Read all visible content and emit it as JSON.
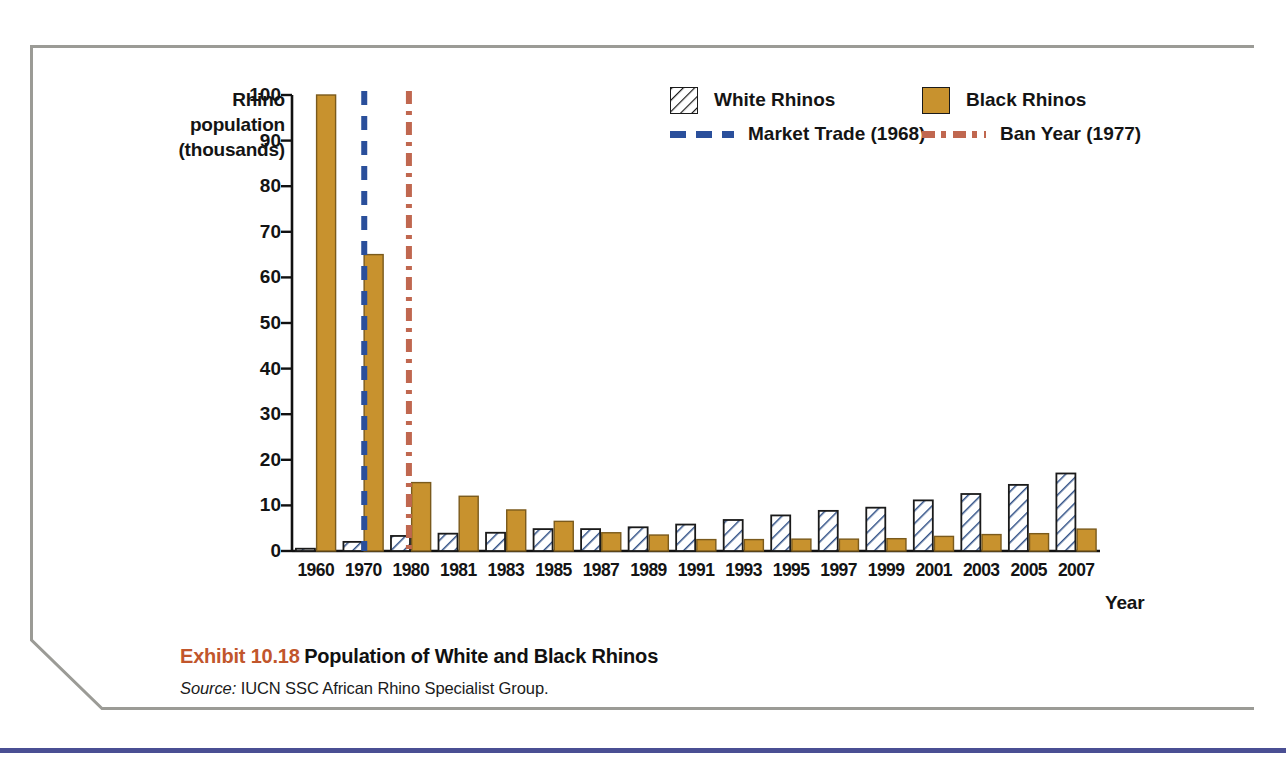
{
  "exhibit": {
    "number": "Exhibit 10.18",
    "title": "Population of White and Black Rhinos",
    "source_label": "Source:",
    "source_text": "IUCN SSC African Rhino Specialist Group."
  },
  "legend": {
    "white_rhinos": "White Rhinos",
    "black_rhinos": "Black Rhinos",
    "market_trade": "Market Trade (1968)",
    "ban_year": "Ban Year (1977)"
  },
  "colors": {
    "black_rhino_fill": "#c8922e",
    "white_rhino_fill": "#ffffff",
    "hatch_stroke": "#2f4f86",
    "market_trade_line": "#2a4f9b",
    "ban_year_line": "#c0674f",
    "exhibit_number": "#c1562c",
    "axis": "#111111",
    "frame": "#9b9b96",
    "bottom_rule": "#4a4f93"
  },
  "chart_data": {
    "type": "bar",
    "title": "Population of White and Black Rhinos",
    "xlabel": "Year",
    "ylabel": "Rhino population (thousands)",
    "ylabel_lines": [
      "Rhino",
      "population",
      "(thousands)"
    ],
    "ylim": [
      0,
      100
    ],
    "yticks": [
      0,
      10,
      20,
      30,
      40,
      50,
      60,
      70,
      80,
      90,
      100
    ],
    "grid": false,
    "legend_position": "top-right",
    "categories": [
      "1960",
      "1970",
      "1980",
      "1981",
      "1983",
      "1985",
      "1987",
      "1989",
      "1991",
      "1993",
      "1995",
      "1997",
      "1999",
      "2001",
      "2003",
      "2005",
      "2007"
    ],
    "series": [
      {
        "name": "White Rhinos",
        "values": [
          0.5,
          2.0,
          3.3,
          3.8,
          4.0,
          4.8,
          4.8,
          5.2,
          5.8,
          6.8,
          7.8,
          8.8,
          9.5,
          11.1,
          12.5,
          14.5,
          17.0
        ]
      },
      {
        "name": "Black Rhinos",
        "values": [
          100.0,
          65.0,
          15.0,
          12.0,
          9.0,
          6.5,
          4.0,
          3.5,
          2.5,
          2.5,
          2.6,
          2.6,
          2.7,
          3.2,
          3.6,
          3.8,
          4.8
        ]
      }
    ],
    "annotations": [
      {
        "label": "Market Trade (1968)",
        "type": "vline",
        "x": 1968,
        "style": "dashed",
        "color": "#2a4f9b"
      },
      {
        "label": "Ban Year (1977)",
        "type": "vline",
        "x": 1977,
        "style": "dashdot",
        "color": "#c0674f"
      }
    ]
  }
}
